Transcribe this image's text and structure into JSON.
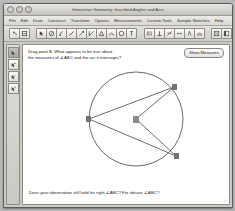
{
  "window": {
    "title": "Interactive Geometry: Inscribed Angles and Arcs",
    "traffic_lights": [
      "close-button",
      "minimize-button",
      "zoom-button"
    ]
  },
  "menubar": {
    "items": [
      {
        "label": "File"
      },
      {
        "label": "Edit"
      },
      {
        "label": "Draw"
      },
      {
        "label": "Construct"
      },
      {
        "label": "Transform"
      },
      {
        "label": "Options"
      },
      {
        "label": "Measurements"
      },
      {
        "label": "Custom Tools"
      },
      {
        "label": "Sample Sketches"
      },
      {
        "label": "Help"
      }
    ]
  },
  "toolbar": {
    "history": [
      {
        "name": "undo-icon"
      },
      {
        "name": "redo-icon"
      }
    ],
    "draw_tools": [
      {
        "name": "arrow-select-icon"
      },
      {
        "name": "circle-tool-icon"
      },
      {
        "name": "point-tool-icon"
      },
      {
        "name": "segment-tool-icon"
      },
      {
        "name": "ray-tool-icon"
      },
      {
        "name": "line-tool-icon"
      },
      {
        "name": "polygon-tool-icon"
      },
      {
        "name": "arc-tool-icon"
      },
      {
        "name": "ellipse-tool-icon"
      },
      {
        "name": "text-tool-icon"
      }
    ],
    "measure_tools": [
      {
        "name": "parallel-icon"
      },
      {
        "name": "perpendicular-icon"
      },
      {
        "name": "angle-measure-icon"
      },
      {
        "name": "distance-icon"
      },
      {
        "name": "compass-icon"
      },
      {
        "name": "protractor-icon"
      }
    ],
    "view_tools": [
      {
        "name": "grid-icon"
      },
      {
        "name": "panel-icon"
      }
    ]
  },
  "palette": {
    "items": [
      {
        "name": "palette-tool-select"
      },
      {
        "name": "palette-tool-point"
      },
      {
        "name": "palette-tool-line"
      },
      {
        "name": "palette-tool-label"
      }
    ]
  },
  "canvas": {
    "prompt_line1": "Drag point B. What appears to be true about",
    "prompt_line2": "the measures of ∠ABC and the arc it intercepts?",
    "show_measures_label": "Show Measures",
    "bottom_question": "Does your observation still hold for right ∠ABC? For obtuse ∠ABC?",
    "figure": {
      "name": "inscribed-angle-circle",
      "circle": {
        "cx": 108,
        "cy": 58,
        "r": 47
      },
      "points": [
        {
          "name": "point-B",
          "x": 61,
          "y": 58
        },
        {
          "name": "point-A",
          "x": 146,
          "y": 26
        },
        {
          "name": "point-C",
          "x": 148,
          "y": 95
        },
        {
          "name": "point-center",
          "x": 108,
          "y": 58
        }
      ],
      "segments": [
        {
          "from": "point-B",
          "to": "point-A"
        },
        {
          "from": "point-B",
          "to": "point-C"
        },
        {
          "from": "point-center",
          "to": "point-A"
        },
        {
          "from": "point-center",
          "to": "point-C"
        }
      ]
    }
  }
}
